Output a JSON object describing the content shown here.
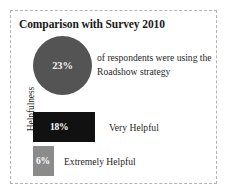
{
  "panel": {
    "title": "Comparison with Survey 2010",
    "border_color": "#b4b4b4",
    "background": "#ffffff"
  },
  "circle_stat": {
    "value": "23%",
    "caption": "of respondents were using the Roadshow strategy",
    "fill_color": "#545454",
    "value_color": "#f2f2f2"
  },
  "bars": {
    "axis_label": "Helpfulness",
    "items": [
      {
        "value": "18%",
        "label": "Very Helpful",
        "color": "#111111"
      },
      {
        "value": "6%",
        "label": "Extremely Helpful",
        "color": "#8b8b8b"
      }
    ]
  },
  "chart_data": {
    "type": "bar",
    "title": "Comparison with Survey 2010",
    "xlabel": "",
    "ylabel": "Helpfulness",
    "categories": [
      "Very Helpful",
      "Extremely Helpful"
    ],
    "values": [
      18,
      6
    ],
    "value_labels": [
      "18%",
      "6%"
    ],
    "units": "percent",
    "xlim": [
      0,
      100
    ],
    "grid": false,
    "legend": "none",
    "colors": [
      "#111111",
      "#8b8b8b"
    ],
    "annotations": [
      {
        "type": "circle-stat",
        "value": 23,
        "value_label": "23%",
        "text": "of respondents were using the Roadshow strategy",
        "color": "#545454"
      }
    ]
  }
}
